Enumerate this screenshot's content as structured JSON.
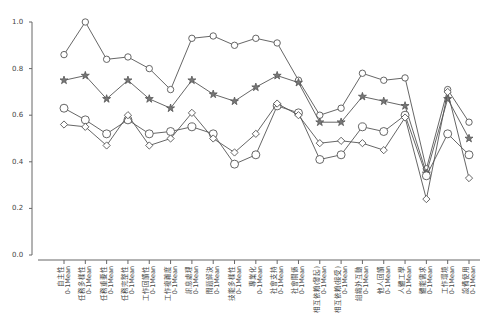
{
  "chart_data": {
    "type": "line",
    "title": "",
    "xlabel": "",
    "ylabel": "",
    "ylim": [
      0.0,
      1.0
    ],
    "yticks": [
      "0.0",
      "0.2",
      "0.4",
      "0.6",
      "0.8",
      "1.0"
    ],
    "grid": false,
    "legend": null,
    "categories": [
      "自主性 0-1Mean",
      "任務多樣性 0-1Mean",
      "任務重要性 0-1Mean",
      "任務完整性 0-1Mean",
      "工作回饋性 0-1Mean",
      "工作複雜度 0-1Mean",
      "訊息處理 0-1Mean",
      "問題解決 0-1Mean",
      "技能多樣性 0-1Mean",
      "專業化 0-1Mean",
      "社會支持 0-1Mean",
      "社會關係 0-1Mean",
      "相互依賴(發起) 0-1Mean",
      "相互依賴(接受) 0-1Mean",
      "組織外互動 0-1Mean",
      "他人回饋 0-1Mean",
      "人體工學 0-1Mean",
      "體能需求 0-1Mean",
      "工作環境 0-1Mean",
      "設備使用 0-1Mean"
    ],
    "series": [
      {
        "name": "Series 1 (small circle)",
        "marker": "circle-small",
        "values": [
          0.86,
          1.0,
          0.84,
          0.85,
          0.8,
          0.71,
          0.93,
          0.94,
          0.9,
          0.93,
          0.91,
          0.75,
          0.6,
          0.63,
          0.78,
          0.75,
          0.76,
          0.37,
          0.71,
          0.57
        ]
      },
      {
        "name": "Series 2 (star)",
        "marker": "star",
        "values": [
          0.75,
          0.77,
          0.67,
          0.75,
          0.67,
          0.63,
          0.75,
          0.69,
          0.66,
          0.72,
          0.77,
          0.74,
          0.57,
          0.57,
          0.68,
          0.66,
          0.64,
          0.35,
          0.67,
          0.5
        ]
      },
      {
        "name": "Series 3 (large circle)",
        "marker": "circle-large",
        "values": [
          0.63,
          0.58,
          0.52,
          0.58,
          0.52,
          0.53,
          0.55,
          0.52,
          0.39,
          0.43,
          0.64,
          0.61,
          0.41,
          0.43,
          0.55,
          0.53,
          0.6,
          0.34,
          0.52,
          0.43
        ]
      },
      {
        "name": "Series 4 (diamond)",
        "marker": "diamond",
        "values": [
          0.56,
          0.55,
          0.47,
          0.6,
          0.47,
          0.5,
          0.61,
          0.5,
          0.44,
          0.52,
          0.65,
          0.6,
          0.48,
          0.49,
          0.48,
          0.45,
          0.59,
          0.24,
          0.7,
          0.33
        ]
      }
    ]
  },
  "axis": {
    "tick_labels_y": [
      "0.0",
      "0.2",
      "0.4",
      "0.6",
      "0.8",
      "1.0"
    ]
  }
}
